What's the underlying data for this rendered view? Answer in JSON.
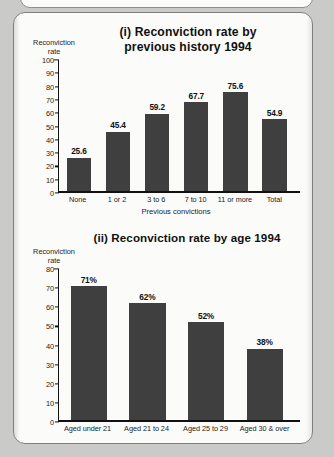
{
  "page": {
    "background_color": "#cacac8",
    "panel_background_color": "#fbfbf9",
    "bar_color": "#3f3f3f",
    "axis_color": "#111111"
  },
  "chart_data": [
    {
      "type": "bar",
      "index_label": "(i)",
      "title": "(i) Reconviction rate by\nprevious history 1994",
      "ylabel": "Reconviction\nrate",
      "xlabel": "Previous convictions",
      "categories": [
        "None",
        "1 or 2",
        "3 to 6",
        "7 to 10",
        "11 or more",
        "Total"
      ],
      "values": [
        25.6,
        45.4,
        59.2,
        67.7,
        75.6,
        54.9
      ],
      "data_labels": [
        "25.6",
        "45.4",
        "59.2",
        "67.7",
        "75.6",
        "54.9"
      ],
      "ylim": [
        0,
        100
      ],
      "yticks": [
        0,
        10,
        20,
        30,
        40,
        50,
        60,
        70,
        80,
        90,
        100
      ],
      "ytick_labels": [
        "0",
        "10",
        "20",
        "30",
        "40",
        "50",
        "60",
        "70",
        "80",
        "90",
        "100"
      ],
      "grid": false,
      "legend": false
    },
    {
      "type": "bar",
      "index_label": "(ii)",
      "title": "(ii) Reconviction rate by age 1994",
      "ylabel": "Reconviction\nrate",
      "xlabel": "",
      "categories": [
        "Aged under 21",
        "Aged 21 to 24",
        "Aged 25 to 29",
        "Aged 30 & over"
      ],
      "values": [
        71,
        62,
        52,
        38
      ],
      "data_labels": [
        "71%",
        "62%",
        "52%",
        "38%"
      ],
      "ylim": [
        0,
        80
      ],
      "yticks": [
        0,
        10,
        20,
        30,
        40,
        50,
        60,
        70,
        80
      ],
      "ytick_labels": [
        "0",
        "10",
        "20",
        "30",
        "40",
        "50",
        "60",
        "70",
        "80"
      ],
      "grid": false,
      "legend": false
    }
  ]
}
